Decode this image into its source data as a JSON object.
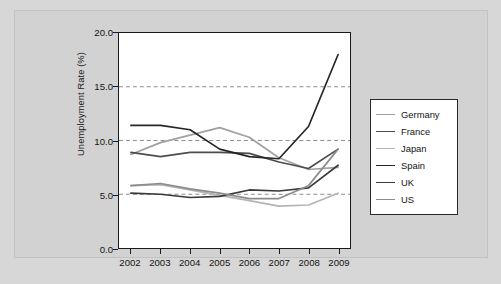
{
  "chart_data": {
    "type": "line",
    "title": "",
    "xlabel": "",
    "ylabel": "Unemployment Rate (%)",
    "categories": [
      "2002",
      "2003",
      "2004",
      "2005",
      "2006",
      "2007",
      "2008",
      "2009"
    ],
    "ylim": [
      0.0,
      20.0
    ],
    "yticks": [
      "0.0",
      "5.0",
      "10.0",
      "15.0",
      "20.0"
    ],
    "ytick_values": [
      0.0,
      5.0,
      10.0,
      15.0,
      20.0
    ],
    "grid": "horizontal-dashed",
    "gridlines": [
      5.0,
      10.0,
      15.0,
      20.0
    ],
    "legend_position": "right",
    "series": [
      {
        "name": "Germany",
        "color": "#a0a0a0",
        "values": [
          8.7,
          9.8,
          10.5,
          11.2,
          10.3,
          8.4,
          7.3,
          7.5
        ]
      },
      {
        "name": "France",
        "color": "#4d4d4d",
        "values": [
          8.9,
          8.5,
          8.9,
          8.9,
          8.8,
          8.0,
          7.4,
          9.2
        ]
      },
      {
        "name": "Japan",
        "color": "#b4b4b4",
        "values": [
          5.8,
          5.9,
          5.4,
          4.9,
          4.4,
          3.9,
          4.0,
          5.1
        ]
      },
      {
        "name": "Spain",
        "color": "#262626",
        "values": [
          11.4,
          11.4,
          11.0,
          9.2,
          8.5,
          8.3,
          11.3,
          18.0
        ]
      },
      {
        "name": "UK",
        "color": "#3a3a3a",
        "values": [
          5.1,
          5.0,
          4.7,
          4.8,
          5.4,
          5.3,
          5.6,
          7.7
        ]
      },
      {
        "name": "US",
        "color": "#8c8c8c",
        "values": [
          5.8,
          6.0,
          5.5,
          5.1,
          4.6,
          4.6,
          5.8,
          9.2
        ]
      }
    ]
  },
  "figure": {
    "background": "#d2d2d2",
    "plot_background": "#ffffff",
    "axis_color": "#1a1a1a",
    "gridline_color": "#8d8d8d"
  }
}
